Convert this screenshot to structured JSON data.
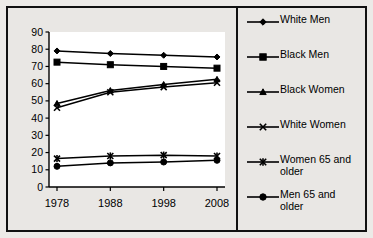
{
  "chart_data": {
    "type": "line",
    "title": "",
    "xlabel": "",
    "ylabel": "",
    "x": [
      1978,
      1988,
      1998,
      2008
    ],
    "categories": [
      "1978",
      "1988",
      "1998",
      "2008"
    ],
    "xtick_labels": [
      "1978",
      "1988",
      "1998",
      "2008"
    ],
    "ytick_labels": [
      "0",
      "10",
      "20",
      "30",
      "40",
      "50",
      "60",
      "70",
      "80",
      "90"
    ],
    "yticks": [
      0,
      10,
      20,
      30,
      40,
      50,
      60,
      70,
      80,
      90
    ],
    "ylim": [
      0,
      90
    ],
    "grid": false,
    "legend_position": "right",
    "series": [
      {
        "name": "White Men",
        "marker": "diamond",
        "color": "#000000",
        "values": [
          79,
          77.5,
          76.5,
          75.5
        ]
      },
      {
        "name": "Black Men",
        "marker": "square",
        "color": "#000000",
        "values": [
          72.5,
          71,
          70,
          69
        ]
      },
      {
        "name": "Black Women",
        "marker": "triangle",
        "color": "#000000",
        "values": [
          48.5,
          56,
          59.5,
          62.5
        ]
      },
      {
        "name": "White Women",
        "marker": "x",
        "color": "#000000",
        "values": [
          46,
          55,
          58,
          60.5
        ]
      },
      {
        "name": "Women 65 and older",
        "marker": "asterisk",
        "color": "#000000",
        "values": [
          16.5,
          18,
          18.5,
          18
        ]
      },
      {
        "name": "Men 65 and older",
        "marker": "circle",
        "color": "#000000",
        "values": [
          12,
          14,
          14.5,
          15.5
        ]
      }
    ]
  },
  "legend": {
    "entries": [
      {
        "label": "White Men",
        "marker": "diamond"
      },
      {
        "label": "Black Men",
        "marker": "square"
      },
      {
        "label": "Black Women",
        "marker": "triangle"
      },
      {
        "label": "White Women",
        "marker": "x"
      },
      {
        "label": "Women 65 and\nolder",
        "marker": "asterisk"
      },
      {
        "label": "Men 65 and\nolder",
        "marker": "circle"
      }
    ]
  },
  "colors": {
    "line": "#000000",
    "plot_background": "#ffffff",
    "figure_background": "#e9e7e4",
    "frame": "#111111",
    "axis": "#000000"
  }
}
